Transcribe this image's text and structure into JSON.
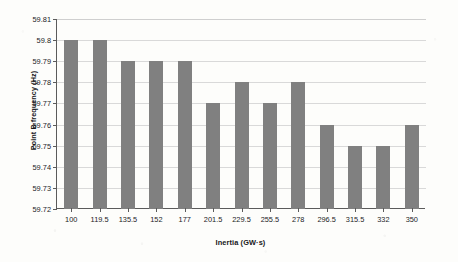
{
  "chart_data": {
    "type": "bar",
    "title": "",
    "xlabel": "Inertia (GW·s)",
    "ylabel": "Point B frequency (Hz)",
    "categories": [
      "100",
      "119.5",
      "135.5",
      "152",
      "177",
      "201.5",
      "229.5",
      "255.5",
      "278",
      "296.5",
      "315.5",
      "332",
      "350"
    ],
    "values": [
      59.8,
      59.8,
      59.79,
      59.79,
      59.79,
      59.77,
      59.78,
      59.77,
      59.78,
      59.76,
      59.75,
      59.75,
      59.76
    ],
    "ylim": [
      59.72,
      59.81
    ],
    "ytick_labels": [
      "59.72",
      "59.73",
      "59.74",
      "59.75",
      "59.76",
      "59.77",
      "59.78",
      "59.79",
      "59.8",
      "59.81"
    ],
    "ytick_values": [
      59.72,
      59.73,
      59.74,
      59.75,
      59.76,
      59.77,
      59.78,
      59.79,
      59.8,
      59.81
    ],
    "grid": true,
    "legend": false,
    "series_color": "#808080"
  }
}
